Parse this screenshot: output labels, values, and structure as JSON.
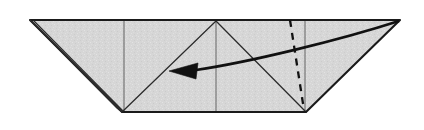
{
  "figure": {
    "title": "Origami fold step diagram",
    "caption": "",
    "domain_kind": "instructional-line-drawing"
  },
  "canvas": {
    "width": 424,
    "height": 130,
    "background_color": "#ffffff"
  },
  "colors": {
    "paper_fill": "#d6d6d6",
    "paper_fill_light": "#e2e2e2",
    "outline": "#1a1a1a",
    "crease": "#555555",
    "fold_line": "#111111",
    "arrow": "#111111"
  },
  "geometry": {
    "top_edge": {
      "label": "top edge",
      "x1": 30,
      "y1": 20,
      "x2": 400,
      "y2": 20
    },
    "bottom_edge": {
      "label": "bottom edge",
      "x1": 122,
      "y1": 112,
      "x2": 306,
      "y2": 112
    },
    "left_tip": {
      "label": "left point",
      "x": 30,
      "y": 20
    },
    "right_tip": {
      "label": "right point",
      "x": 400,
      "y": 20
    },
    "bottom_left_vertex": {
      "label": "bottom left corner",
      "x": 122,
      "y": 112
    },
    "bottom_right_vertex": {
      "label": "bottom right corner",
      "x": 306,
      "y": 112
    },
    "center_apex": {
      "label": "center apex",
      "x": 216,
      "y": 21
    },
    "vertical_crease_left_x": 124,
    "vertical_crease_right_x": 305,
    "vertical_center_x": 216,
    "body_outline_points": "30,20 400,20 306,112 122,112",
    "center_triangle_points": "216,21 306,112 122,112",
    "left_flap_points": "30,20 122,112 117,108",
    "right_wing_points": "400,20 306,112 305,20",
    "left_wing_points": "30,20 122,112 124,20"
  },
  "fold_line": {
    "name": "valley fold (dashed)",
    "style": "dashed",
    "path": "M 290 20 L 304 110",
    "dash_pattern": "7 6"
  },
  "arrow": {
    "name": "fold direction arrow",
    "direction": "right-to-left",
    "curve_path": "M 399 21 C 340 40 250 62 196 70",
    "head_tip": {
      "x": 169,
      "y": 71
    },
    "head_points": "169,71 198,63 196,79",
    "shaft_path": "M 196 71 L 186 71"
  },
  "creases": [
    {
      "name": "left vertical crease",
      "path": "M 124 20 L 124 112"
    },
    {
      "name": "right vertical crease",
      "path": "M 305 20 L 305 112"
    },
    {
      "name": "center vertical crease",
      "path": "M 216 21 L 216 112"
    },
    {
      "name": "apex left diagonal",
      "path": "M 216 21 L 122 112"
    },
    {
      "name": "apex right diagonal",
      "path": "M 216 21 L 306 112"
    }
  ],
  "texture": {
    "kind": "speckled-gray",
    "base": "#d6d6d6",
    "speck_light": "#e4e4e4",
    "speck_dark": "#c9c9c9"
  }
}
